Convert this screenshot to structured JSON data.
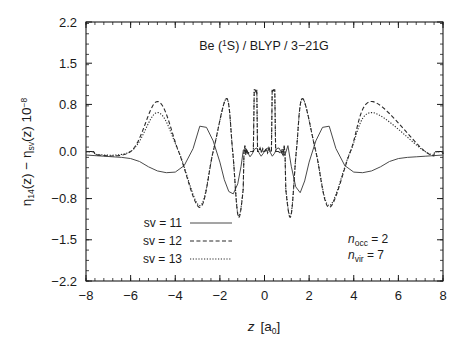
{
  "chart_data": {
    "type": "line",
    "title_parts": {
      "element": "Be (",
      "multiplicity_sup": "1",
      "term": "S) / BLYP / 3",
      "dash": "−",
      "basis": "21G"
    },
    "xlabel": "z  [a0]",
    "xlabel_parts": {
      "symbol": "z",
      "bracket_open": "[a",
      "sub": "0",
      "bracket_close": "]"
    },
    "ylabel": "η14(z) − ηsv(z) 10-8",
    "ylabel_parts": {
      "eta1": "η",
      "sub1": "14",
      "mid1": "(z) − ",
      "eta2": "η",
      "sub2": "sv",
      "mid2": "(z) 10",
      "sup": "−8"
    },
    "xlim": [
      -8,
      8
    ],
    "ylim": [
      -2.2,
      2.2
    ],
    "xticks": [
      -8,
      -6,
      -4,
      -2,
      0,
      2,
      4,
      6,
      8
    ],
    "xticklabels": [
      "−8",
      "−6",
      "−4",
      "−2",
      "0",
      "2",
      "4",
      "6",
      "8"
    ],
    "yticks": [
      2.2,
      1.5,
      0.8,
      0.0,
      -0.8,
      -1.5,
      -2.2
    ],
    "yticklabels": [
      "2.2",
      "1.5",
      "0.8",
      "0.0",
      "−0.8",
      "−1.5",
      "−2.2"
    ],
    "x_minor_step": 0.4,
    "y_minor_step": 0.175,
    "grid": false,
    "legend_position": "lower-left",
    "series": [
      {
        "name": "sv = 11",
        "style": "solid",
        "color": "#4a4a4a",
        "description": "Slowly oscillating broad envelope; negative lobe near z=-4.8, positive lobe near z=-2.9, small ripples in core region.",
        "points": [
          [
            -8.0,
            -0.06
          ],
          [
            -7.6,
            -0.07
          ],
          [
            -7.2,
            -0.08
          ],
          [
            -6.8,
            -0.09
          ],
          [
            -6.4,
            -0.1
          ],
          [
            -6.0,
            -0.12
          ],
          [
            -5.6,
            -0.17
          ],
          [
            -5.2,
            -0.26
          ],
          [
            -4.8,
            -0.33
          ],
          [
            -4.4,
            -0.36
          ],
          [
            -4.0,
            -0.35
          ],
          [
            -3.6,
            -0.24
          ],
          [
            -3.2,
            0.05
          ],
          [
            -2.9,
            0.43
          ],
          [
            -2.6,
            0.41
          ],
          [
            -2.3,
            0.18
          ],
          [
            -2.0,
            -0.18
          ],
          [
            -1.8,
            -0.48
          ],
          [
            -1.6,
            -0.68
          ],
          [
            -1.4,
            -0.72
          ],
          [
            -1.2,
            -0.55
          ],
          [
            -1.05,
            -0.25
          ],
          [
            -0.95,
            0.02
          ],
          [
            -0.85,
            0.06
          ],
          [
            -0.75,
            -0.02
          ],
          [
            -0.65,
            -0.09
          ],
          [
            -0.55,
            -0.04
          ],
          [
            -0.45,
            0.04
          ],
          [
            -0.35,
            0.06
          ],
          [
            -0.25,
            -0.02
          ],
          [
            -0.15,
            -0.08
          ],
          [
            -0.05,
            -0.03
          ],
          [
            0.05,
            0.04
          ],
          [
            0.15,
            0.06
          ],
          [
            0.25,
            -0.01
          ],
          [
            0.35,
            -0.08
          ],
          [
            0.45,
            -0.03
          ],
          [
            0.55,
            0.05
          ],
          [
            0.65,
            0.06
          ],
          [
            0.75,
            -0.01
          ],
          [
            0.85,
            -0.08
          ],
          [
            0.95,
            -0.02
          ],
          [
            1.05,
            0.1
          ],
          [
            1.2,
            -0.25
          ],
          [
            1.4,
            -0.6
          ],
          [
            1.6,
            -0.7
          ],
          [
            1.8,
            -0.5
          ],
          [
            2.0,
            -0.18
          ],
          [
            2.3,
            0.18
          ],
          [
            2.6,
            0.41
          ],
          [
            2.9,
            0.43
          ],
          [
            3.2,
            0.05
          ],
          [
            3.6,
            -0.24
          ],
          [
            4.0,
            -0.35
          ],
          [
            4.4,
            -0.36
          ],
          [
            4.8,
            -0.33
          ],
          [
            5.2,
            -0.26
          ],
          [
            5.6,
            -0.17
          ],
          [
            6.0,
            -0.12
          ],
          [
            6.4,
            -0.1
          ],
          [
            6.8,
            -0.09
          ],
          [
            7.2,
            -0.08
          ],
          [
            7.6,
            -0.07
          ],
          [
            8.0,
            -0.06
          ]
        ]
      },
      {
        "name": "sv = 12",
        "style": "dashed",
        "color": "#2a2a2a",
        "description": "Large positive lobe at z=-4.8 (+0.85), deep trough at z=-2.9 (-0.95), peak at z=-1.7 (+0.9), sharp narrow spikes at z=+-0.4 reaching +1.05, deep narrow troughs at z=+-1.1 (-1.1).",
        "peaks": [
          {
            "z": -4.8,
            "value": 0.85
          },
          {
            "z": -2.9,
            "value": -0.95
          },
          {
            "z": -1.7,
            "value": 0.9
          },
          {
            "z": -1.15,
            "value": -1.12
          },
          {
            "z": -0.4,
            "value": 1.05
          },
          {
            "z": 0.4,
            "value": 1.05
          },
          {
            "z": 1.15,
            "value": -1.12
          },
          {
            "z": 1.7,
            "value": 0.9
          },
          {
            "z": 2.9,
            "value": -0.95
          },
          {
            "z": 4.8,
            "value": 0.85
          }
        ]
      },
      {
        "name": "sv = 13",
        "style": "dotted",
        "color": "#2a2a2a",
        "description": "Nearly coincident with sv=12 but slightly lower outer lobes (+0.75 at z=-4.8).",
        "peaks": [
          {
            "z": -4.8,
            "value": 0.75
          },
          {
            "z": -2.9,
            "value": -0.92
          },
          {
            "z": -1.7,
            "value": 0.9
          },
          {
            "z": -1.15,
            "value": -1.1
          },
          {
            "z": -0.4,
            "value": 1.05
          },
          {
            "z": 0.4,
            "value": 1.05
          },
          {
            "z": 1.15,
            "value": -1.1
          },
          {
            "z": 1.7,
            "value": 0.9
          },
          {
            "z": 2.9,
            "value": -0.92
          },
          {
            "z": 4.8,
            "value": 0.75
          }
        ]
      }
    ],
    "annotations": [
      {
        "id": "n-occ",
        "text": "nocc = 2",
        "parts": {
          "sym": "n",
          "sub": "occ",
          "eq": " = 2"
        }
      },
      {
        "id": "n-vir",
        "text": "nvir = 7",
        "parts": {
          "sym": "n",
          "sub": "vir",
          "eq": " = 7"
        }
      }
    ],
    "legend": [
      {
        "label": "sv = 11",
        "style": "solid"
      },
      {
        "label": "sv = 12",
        "style": "dashed"
      },
      {
        "label": "sv = 13",
        "style": "dotted"
      }
    ]
  },
  "colors": {
    "background": "#ffffff",
    "axis": "#1a1a1a",
    "solid_curve": "#4a4a4a",
    "broken_curve": "#2a2a2a"
  }
}
